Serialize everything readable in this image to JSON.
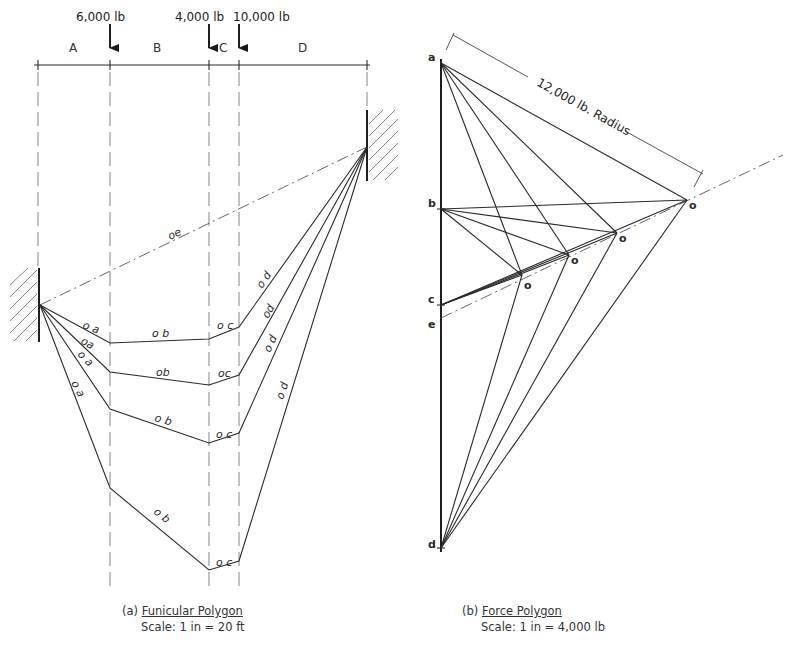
{
  "funicular": {
    "loads": [
      {
        "label": "6,000 lb",
        "x": 110
      },
      {
        "label": "4,000 lb",
        "x": 209
      },
      {
        "label": "10,000 lb",
        "x": 239
      }
    ],
    "spans": [
      "A",
      "B",
      "C",
      "D"
    ],
    "closing_line_label": "oe",
    "ray_labels": {
      "poly1": [
        "o a",
        "o b",
        "o c",
        "o d"
      ],
      "poly2": [
        "oa",
        "ob",
        "oc",
        "od"
      ],
      "poly3": [
        "o a",
        "o b",
        "o c",
        "o d"
      ],
      "poly4": [
        "o a",
        "o b",
        "o c",
        "o d"
      ]
    },
    "caption_prefix": "(a)",
    "caption_title": "Funicular Polygon",
    "caption_scale": "Scale: 1 in = 20 ft"
  },
  "force": {
    "points": [
      "a",
      "b",
      "c",
      "e",
      "d"
    ],
    "pole_label": "o",
    "radius_label": "12,000 lb. Radius",
    "caption_prefix": "(b)",
    "caption_title": "Force Polygon",
    "caption_scale": "Scale: 1 in = 4,000 lb"
  }
}
